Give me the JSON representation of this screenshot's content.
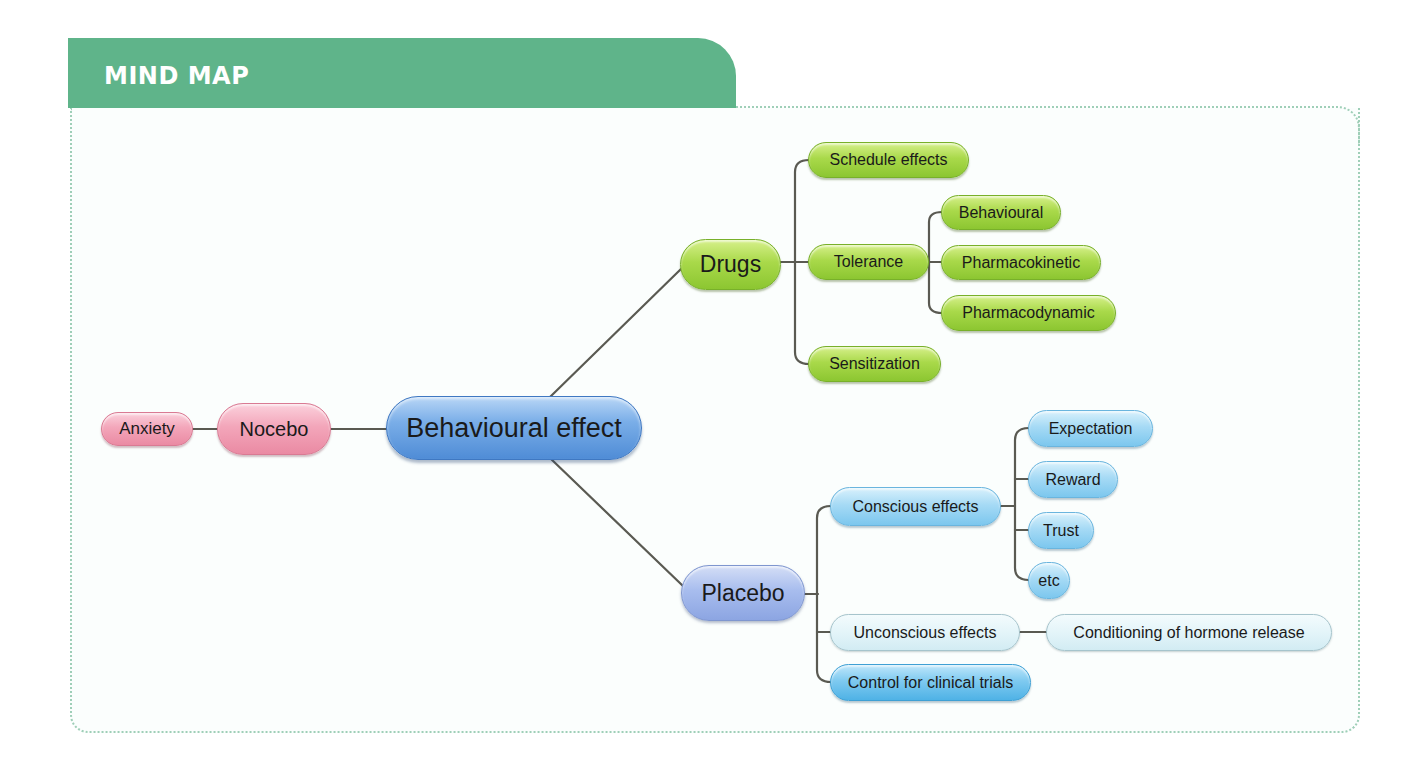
{
  "header": {
    "title": "MIND MAP"
  },
  "mindmap": {
    "root": {
      "label": "Behavioural effect"
    },
    "nocebo": {
      "label": "Nocebo"
    },
    "anxiety": {
      "label": "Anxiety"
    },
    "drugs": {
      "label": "Drugs",
      "children": {
        "schedule": {
          "label": "Schedule effects"
        },
        "tolerance": {
          "label": "Tolerance",
          "children": {
            "behavioural": {
              "label": "Behavioural"
            },
            "pharmacokinetic": {
              "label": "Pharmacokinetic"
            },
            "pharmacodynamic": {
              "label": "Pharmacodynamic"
            }
          }
        },
        "sensitization": {
          "label": "Sensitization"
        }
      }
    },
    "placebo": {
      "label": "Placebo",
      "children": {
        "conscious": {
          "label": "Conscious effects",
          "children": {
            "expectation": {
              "label": "Expectation"
            },
            "reward": {
              "label": "Reward"
            },
            "trust": {
              "label": "Trust"
            },
            "etc": {
              "label": "etc"
            }
          }
        },
        "unconscious": {
          "label": "Unconscious effects",
          "children": {
            "conditioning": {
              "label": "Conditioning of hormone release"
            }
          }
        },
        "control": {
          "label": "Control for clinical trials"
        }
      }
    }
  },
  "colors": {
    "header_green": "#5fb48a",
    "drug_green": "#a9d94a",
    "root_blue": "#7aaee8",
    "placebo_periwinkle": "#a8bdee",
    "nocebo_pink": "#f3a6ba",
    "conscious_cyan": "#a6daf5",
    "control_cyan": "#7fcaf0",
    "unconscious_pale": "#e0f3f8",
    "connector": "#5a5a52",
    "frame_dotted": "#9fcfb8"
  }
}
